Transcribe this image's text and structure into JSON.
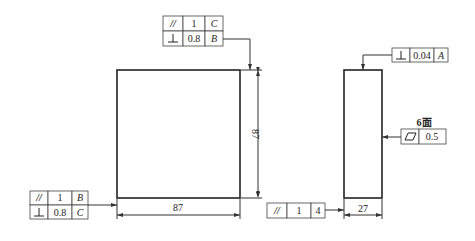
{
  "drawing": {
    "main_part": {
      "width_dim": "87",
      "height_dim": "87",
      "fcf_top": {
        "rows": [
          {
            "symbol": "//",
            "symbol_name": "parallelism",
            "tolerance": "1",
            "datum": "C"
          },
          {
            "symbol": "⊥",
            "symbol_name": "perpendicularity",
            "tolerance": "0.8",
            "datum": "B"
          }
        ]
      },
      "fcf_left": {
        "rows": [
          {
            "symbol": "//",
            "symbol_name": "parallelism",
            "tolerance": "1",
            "datum": "B"
          },
          {
            "symbol": "⊥",
            "symbol_name": "perpendicularity",
            "tolerance": "0.8",
            "datum": "C"
          }
        ]
      }
    },
    "side_part": {
      "width_dim": "27",
      "fcf_top": {
        "symbol": "⊥",
        "symbol_name": "perpendicularity",
        "tolerance": "0.04",
        "datum": "A"
      },
      "flatness_note": "6面",
      "fcf_flatness": {
        "symbol": "▱",
        "symbol_name": "flatness",
        "tolerance": "0.5"
      },
      "fcf_bottom": {
        "symbol": "//",
        "symbol_name": "parallelism",
        "tolerance": "1",
        "datum": "4"
      }
    }
  }
}
